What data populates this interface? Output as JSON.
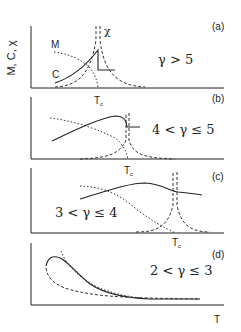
{
  "figure": {
    "y_axis_label": "M, C, χ",
    "x_axis_label": "T",
    "curve_labels": {
      "magnetization": "M",
      "specific_heat": "C",
      "susceptibility": "χ"
    },
    "legend_styles": {
      "M": "dotted",
      "C": "solid",
      "chi": "dashed"
    },
    "panels": [
      {
        "id": "a",
        "tag": "(a)",
        "condition": "γ > 5",
        "tc_label": "T",
        "tc_sub": "c"
      },
      {
        "id": "b",
        "tag": "(b)",
        "condition": "4 < γ ≤ 5",
        "tc_label": "T",
        "tc_sub": "c"
      },
      {
        "id": "c",
        "tag": "(c)",
        "condition": "3 < γ ≤ 4",
        "tc_label": "T",
        "tc_sub": "c"
      },
      {
        "id": "d",
        "tag": "(d)",
        "condition": "2 < γ ≤ 3"
      }
    ],
    "colors": {
      "ink": "#222222",
      "background": "#ffffff"
    }
  }
}
